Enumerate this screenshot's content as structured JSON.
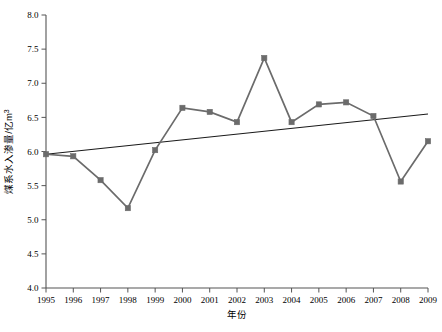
{
  "chart_data": {
    "type": "line",
    "title": "",
    "xlabel": "年份",
    "ylabel": "煤系水入渗量/亿m³",
    "x": [
      1995,
      1996,
      1997,
      1998,
      1999,
      2000,
      2001,
      2002,
      2003,
      2004,
      2005,
      2006,
      2007,
      2008,
      2009
    ],
    "categories": [
      "1995",
      "1996",
      "1997",
      "1998",
      "1999",
      "2000",
      "2001",
      "2002",
      "2003",
      "2004",
      "2005",
      "2006",
      "2007",
      "2008",
      "2009"
    ],
    "series": [
      {
        "name": "煤系水入渗量",
        "color": "#6b6b6b",
        "marker": "square",
        "values": [
          5.96,
          5.93,
          5.58,
          5.17,
          6.02,
          6.64,
          6.58,
          6.43,
          7.37,
          6.43,
          6.69,
          6.72,
          6.52,
          5.56,
          6.15
        ]
      },
      {
        "name": "线性趋势线",
        "color": "#1a1a1a",
        "marker": "none",
        "type": "trend",
        "values": [
          5.96,
          6.0,
          6.04,
          6.08,
          6.13,
          6.17,
          6.21,
          6.25,
          6.29,
          6.34,
          6.38,
          6.42,
          6.46,
          6.5,
          6.55
        ]
      }
    ],
    "ylim": [
      4.0,
      8.0
    ],
    "ytick_values": [
      4.0,
      4.5,
      5.0,
      5.5,
      6.0,
      6.5,
      7.0,
      7.5,
      8.0
    ],
    "ytick_labels": [
      "4.0",
      "4.5",
      "5.0",
      "5.5",
      "6.0",
      "6.5",
      "7.0",
      "7.5",
      "8.0"
    ],
    "xtick_labels": [
      "1995",
      "1996",
      "1997",
      "1998",
      "1999",
      "2000",
      "2001",
      "2002",
      "2003",
      "2004",
      "2005",
      "2006",
      "2007",
      "2008",
      "2009"
    ],
    "grid": false,
    "legend": "none",
    "axis_color": "#555555",
    "background": "#ffffff"
  }
}
